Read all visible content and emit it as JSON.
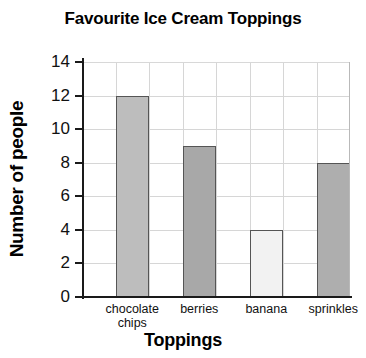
{
  "chart_data": {
    "type": "bar",
    "title": "Favourite Ice Cream Toppings",
    "xlabel": "Toppings",
    "ylabel": "Number of people",
    "categories": [
      "chocolate\nchips",
      "berries",
      "banana",
      "sprinkles"
    ],
    "values": [
      12,
      9,
      4,
      8
    ],
    "ylim": [
      0,
      14
    ],
    "ytick_values": [
      0,
      2,
      4,
      6,
      8,
      10,
      12,
      14
    ],
    "ytick_labels": [
      "0",
      "2",
      "4",
      "6",
      "8",
      "10",
      "12",
      "14"
    ],
    "grid": true,
    "legend": "none",
    "bar_colors": [
      "#bdbdbd",
      "#a8a8a8",
      "#f2f2f2",
      "#aeaeae"
    ],
    "bar_border_color": "#555555",
    "gridline_color": "#d6d6d6",
    "axis_color": "#1a1a1a",
    "background_color": "#ffffff"
  }
}
